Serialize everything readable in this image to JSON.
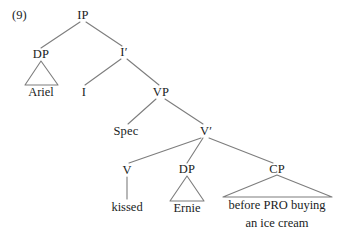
{
  "figure": {
    "example_number": "(9)",
    "type": "syntax-tree",
    "line_color": "#7d7d7d",
    "text_color": "#201d1d",
    "background": "#ffffff"
  },
  "nodes": {
    "example_label": "(9)",
    "ip": "IP",
    "dp_subject": "DP",
    "ariel": "Ariel",
    "i_bar": "I′",
    "i_head": "I",
    "vp": "VP",
    "spec": "Spec",
    "v_bar": "V′",
    "v_head": "V",
    "kissed": "kissed",
    "dp_object": "DP",
    "ernie": "Ernie",
    "cp": "CP",
    "cp_text_line1": "before PRO buying",
    "cp_text_line2": "an ice cream"
  }
}
